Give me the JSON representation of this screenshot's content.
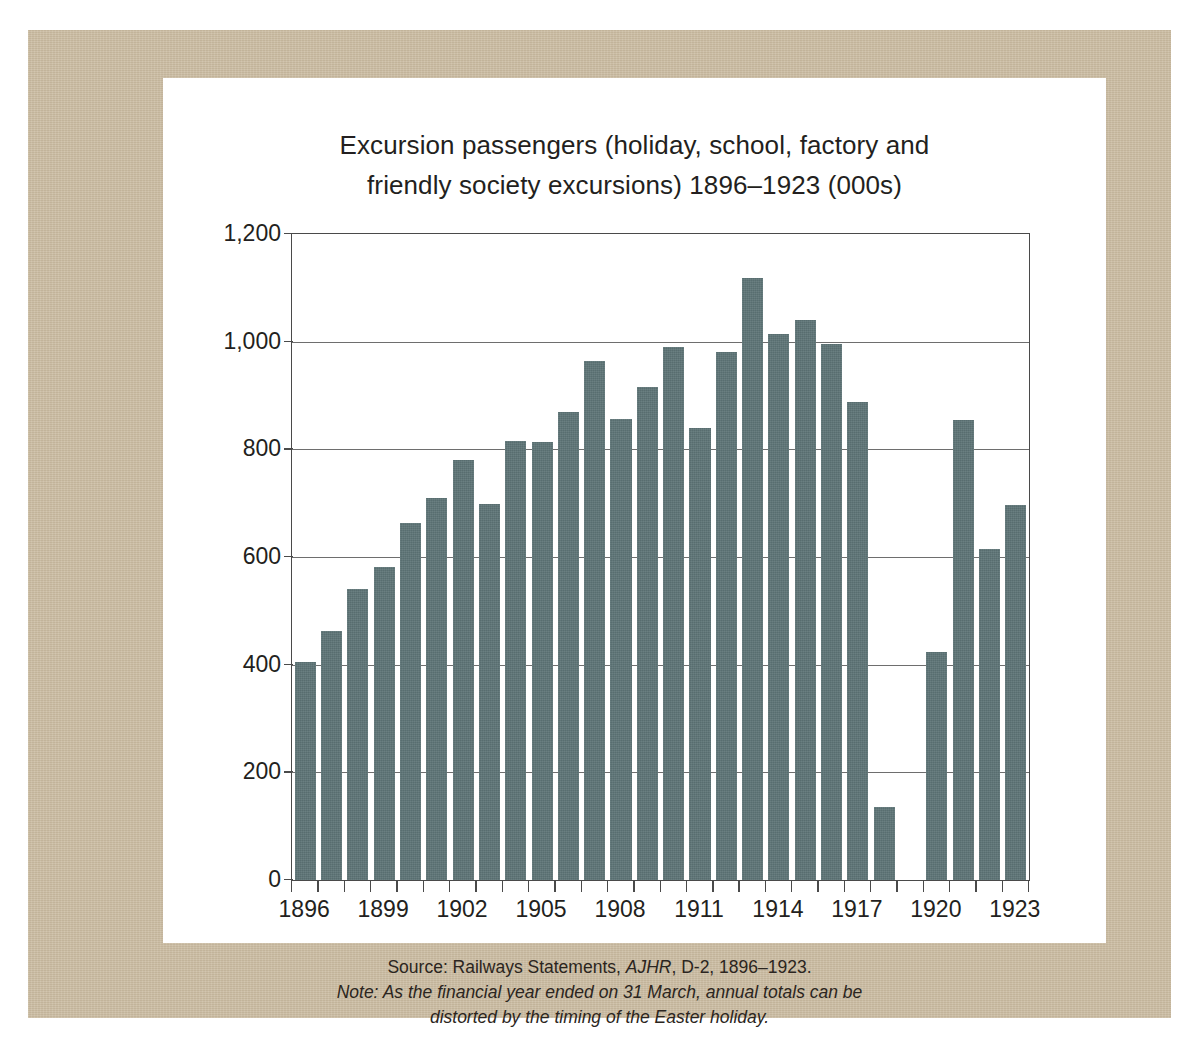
{
  "figure": {
    "title_line1": "Excursion passengers (holiday, school, factory and",
    "title_line2": "friendly society excursions) 1896–1923 (000s)",
    "caption_source_prefix": "Source: Railways Statements, ",
    "caption_source_italic": "AJHR",
    "caption_source_suffix": ", D-2, 1896–1923.",
    "caption_note_line1": "Note: As the financial year ended on 31 March, annual totals can be",
    "caption_note_line2": "distorted by the timing of the Easter holiday.",
    "colors": {
      "bar": "#5d7476",
      "board": "#c9ba9f",
      "card": "#ffffff",
      "axis": "#4a4a4a",
      "grid": "#6e6e6e",
      "text": "#231f20"
    }
  },
  "chart_data": {
    "type": "bar",
    "title": "Excursion passengers (holiday, school, factory and friendly society excursions) 1896–1923 (000s)",
    "xlabel": "",
    "ylabel": "",
    "ylim": [
      0,
      1200
    ],
    "ytick_values": [
      0,
      200,
      400,
      600,
      800,
      1000,
      1200
    ],
    "ytick_labels": [
      "0",
      "200",
      "400",
      "600",
      "800",
      "1,000",
      "1,200"
    ],
    "grid": true,
    "legend": "none",
    "xtick_labels": [
      "1896",
      "1899",
      "1902",
      "1905",
      "1908",
      "1911",
      "1914",
      "1917",
      "1920",
      "1923"
    ],
    "categories": [
      "1896",
      "1897",
      "1898",
      "1899",
      "1900",
      "1901",
      "1902",
      "1903",
      "1904",
      "1905",
      "1906",
      "1907",
      "1908",
      "1909",
      "1910",
      "1911",
      "1912",
      "1913",
      "1914",
      "1915",
      "1916",
      "1917",
      "1918",
      "1919",
      "1920",
      "1921",
      "1922",
      "1923"
    ],
    "values": [
      405,
      463,
      540,
      581,
      663,
      709,
      780,
      698,
      815,
      813,
      870,
      965,
      857,
      915,
      990,
      839,
      981,
      1118,
      1015,
      1040,
      995,
      888,
      135,
      null,
      424,
      855,
      614,
      697
    ],
    "units": "thousands of passengers"
  }
}
